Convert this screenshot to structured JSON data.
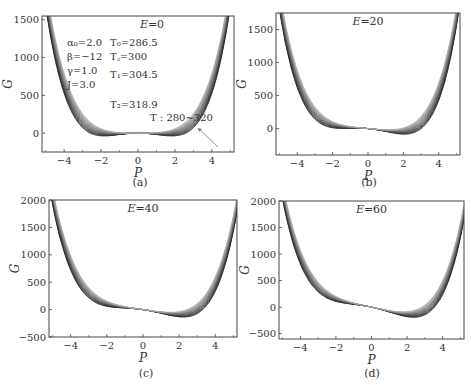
{
  "figure": {
    "subplot_labels": [
      "(a)",
      "(b)",
      "(c)",
      "(d)"
    ]
  },
  "chart_data": [
    {
      "type": "line",
      "panel": "(a)",
      "title": "E=0",
      "xlabel": "P",
      "ylabel": "G",
      "xlim": [
        -5.2,
        5.2
      ],
      "ylim": [
        -250,
        1550
      ],
      "xticks": [
        -4,
        -2,
        0,
        2,
        4
      ],
      "yticks": [
        0,
        500,
        1000,
        1500
      ],
      "E": 0,
      "grid": false,
      "parameters": [
        "α₀=2.0",
        "β=−12",
        "γ=1.0",
        "J=3.0"
      ],
      "temperatures": [
        "T₀=286.5",
        "T꜀=300",
        "T₁=304.5",
        "T₂=318.9"
      ],
      "annotation": "T : 280~320",
      "series_count": 15,
      "series_note": "Family of G(P) curves for T from 280 to 320; curves at low T show double wells with minima ≈ -230 near P=±3.6, high T curves are single-well",
      "approx_min_lowest_T": {
        "P": [
          -3.6,
          3.6
        ],
        "G": [
          -230,
          -230
        ]
      },
      "approx_G_at_P_edge": {
        "P": 5.0,
        "G_range": [
          700,
          1500
        ]
      }
    },
    {
      "type": "line",
      "panel": "(b)",
      "title": "E=20",
      "xlabel": "P",
      "ylabel": "G",
      "xlim": [
        -5.2,
        5.2
      ],
      "ylim": [
        -400,
        1750
      ],
      "xticks": [
        -4,
        -2,
        0,
        2,
        4
      ],
      "yticks": [
        0,
        500,
        1000,
        1500
      ],
      "E": 20,
      "grid": false,
      "series_count": 15,
      "approx_min_lowest_T": {
        "P": [
          -3.5,
          3.7
        ],
        "G": [
          -160,
          -300
        ]
      },
      "approx_G_at_P_edge": {
        "P_left": -5.0,
        "G_left_max": 1650,
        "P_right": 5.0,
        "G_right_max": 1450
      }
    },
    {
      "type": "line",
      "panel": "(c)",
      "title": "E=40",
      "xlabel": "P",
      "ylabel": "G",
      "xlim": [
        -5.2,
        5.2
      ],
      "ylim": [
        -500,
        2000
      ],
      "xticks": [
        -4,
        -2,
        0,
        2,
        4
      ],
      "yticks": [
        -500,
        0,
        500,
        1000,
        1500,
        2000
      ],
      "E": 40,
      "grid": false,
      "series_count": 15,
      "approx_min_lowest_T": {
        "P": [
          -3.4,
          3.8
        ],
        "G": [
          -80,
          -360
        ]
      },
      "approx_G_at_P_edge": {
        "P_left": -5.0,
        "G_left_max": 1750,
        "P_right": 5.0,
        "G_right_max": 1350
      }
    },
    {
      "type": "line",
      "panel": "(d)",
      "title": "E=60",
      "xlabel": "P",
      "ylabel": "G",
      "xlim": [
        -5.2,
        5.2
      ],
      "ylim": [
        -600,
        2000
      ],
      "xticks": [
        -4,
        -2,
        0,
        2,
        4
      ],
      "yticks": [
        -500,
        0,
        500,
        1000,
        1500,
        2000
      ],
      "E": 60,
      "grid": false,
      "series_count": 15,
      "approx_min_lowest_T": {
        "P": [
          -3.3,
          3.8
        ],
        "G": [
          -20,
          -440
        ]
      },
      "approx_G_at_P_edge": {
        "P_left": -5.0,
        "G_left_max": 1850,
        "P_right": 5.0,
        "G_right_max": 1250
      }
    }
  ]
}
